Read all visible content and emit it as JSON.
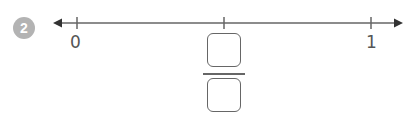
{
  "question": {
    "number": "2"
  },
  "number_line": {
    "start_label": "0",
    "end_label": "1",
    "ticks": [
      0,
      0.5,
      1
    ],
    "arrows": "both",
    "line_color": "#666666"
  },
  "fraction_answer": {
    "numerator_value": "",
    "denominator_value": "",
    "position": "midpoint"
  },
  "colors": {
    "badge_bg": "#b3b3b3",
    "badge_text": "#ffffff",
    "stroke": "#666666"
  }
}
